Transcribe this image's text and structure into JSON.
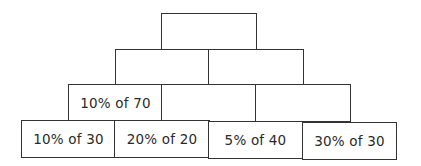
{
  "diagram": {
    "type": "number-pyramid",
    "rows": [
      {
        "level": 1,
        "bricks": [
          {
            "label": ""
          }
        ]
      },
      {
        "level": 2,
        "bricks": [
          {
            "label": ""
          },
          {
            "label": ""
          }
        ]
      },
      {
        "level": 3,
        "bricks": [
          {
            "label": "10% of 70"
          },
          {
            "label": ""
          },
          {
            "label": ""
          }
        ]
      },
      {
        "level": 4,
        "bricks": [
          {
            "label": "10% of 30"
          },
          {
            "label": "20% of 20"
          },
          {
            "label": "5% of 40"
          },
          {
            "label": "30% of 30"
          }
        ]
      }
    ],
    "colors": {
      "border": "#333333",
      "background": "#ffffff",
      "text": "#2a2a2a"
    }
  }
}
